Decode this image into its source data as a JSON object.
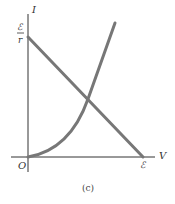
{
  "diagram": {
    "caption": "(c)",
    "axes": {
      "y_label": "I",
      "x_label": "V",
      "origin_label": "O",
      "y_intercept_label_top": "ℰ",
      "y_intercept_label_bottom": "r",
      "x_intercept_label": "ℰ"
    },
    "curves": [
      {
        "name": "load-line",
        "type": "line",
        "description": "Straight line from I=ℰ/r at V=0 down to V=ℰ at I=0"
      },
      {
        "name": "device-curve",
        "type": "curve",
        "description": "Nonlinear increasing curve starting from origin"
      }
    ],
    "colors": {
      "axis": "#333333",
      "curve": "#777777",
      "text": "#333333"
    }
  }
}
